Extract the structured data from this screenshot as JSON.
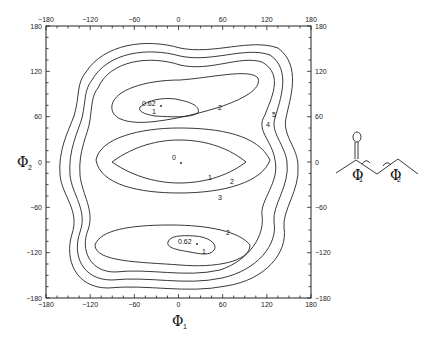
{
  "chart_data": {
    "type": "contour",
    "title": "",
    "xlabel": "Φ1",
    "ylabel": "Φ2",
    "xlim": [
      -180,
      180
    ],
    "ylim": [
      -180,
      180
    ],
    "x_ticks": [
      -180,
      -120,
      -60,
      0,
      60,
      120,
      180
    ],
    "y_ticks": [
      -180,
      -120,
      -60,
      0,
      60,
      120,
      180
    ],
    "grid": false,
    "contour_levels": [
      1,
      2,
      3,
      4,
      5
    ],
    "contour_labels": [
      {
        "text": "1",
        "x": -30,
        "y": 100
      },
      {
        "text": "2",
        "x": 60,
        "y": 72
      },
      {
        "text": "1",
        "x": 25,
        "y": -25
      },
      {
        "text": "2",
        "x": 52,
        "y": -32
      },
      {
        "text": "3",
        "x": 70,
        "y": -45
      },
      {
        "text": "4",
        "x": 112,
        "y": 40
      },
      {
        "text": "5",
        "x": 120,
        "y": 60
      },
      {
        "text": "2",
        "x": 25,
        "y": -100
      },
      {
        "text": "1",
        "x": 25,
        "y": -128
      }
    ],
    "minima": [
      {
        "label": "0.62",
        "phi1": -25,
        "phi2": 110
      },
      {
        "label": "0",
        "phi1": 0,
        "phi2": 0
      },
      {
        "label": "0.62",
        "phi1": 25,
        "phi2": -110
      }
    ]
  },
  "molecule": {
    "atom_label": "O",
    "torsion_labels": [
      "Φ1",
      "Φ2"
    ]
  }
}
